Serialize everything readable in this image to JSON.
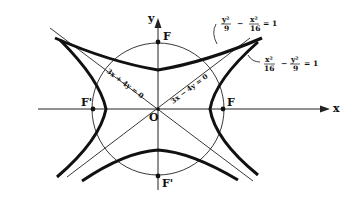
{
  "diagram": {
    "axes": {
      "x_label": "x",
      "y_label": "y",
      "origin_label": "O"
    },
    "foci": {
      "right": "F",
      "left": "F'",
      "top": "F",
      "bottom": "F'"
    },
    "asymptotes": {
      "pos_slope": "3x − 4y = 0",
      "neg_slope": "3x + 4y = 0"
    },
    "equations": {
      "vertical_hyperbola": {
        "t1_num": "y²",
        "t1_den": "9",
        "op": "−",
        "t2_num": "x²",
        "t2_den": "16",
        "rhs": "= 1"
      },
      "horizontal_hyperbola": {
        "t1_num": "x²",
        "t1_den": "16",
        "op": "−",
        "t2_num": "y²",
        "t2_den": "9",
        "rhs": "= 1"
      }
    }
  }
}
